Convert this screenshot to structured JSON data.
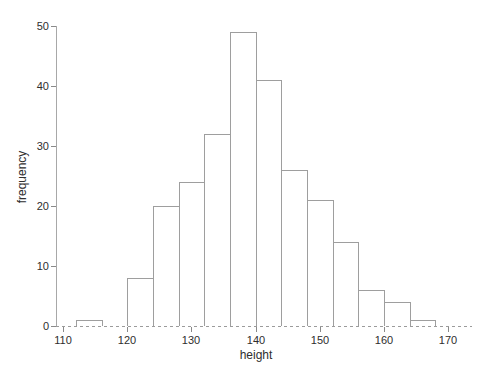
{
  "chart_data": {
    "type": "bar",
    "subtype": "histogram",
    "title": "",
    "xlabel": "height",
    "ylabel": "frequency",
    "bin_edges": [
      112,
      116,
      120,
      124,
      128,
      132,
      136,
      140,
      144,
      148,
      152,
      156,
      160,
      164,
      168
    ],
    "counts": [
      1,
      0,
      8,
      20,
      24,
      32,
      49,
      41,
      26,
      21,
      14,
      6,
      4,
      1
    ],
    "x_ticks": [
      110,
      120,
      130,
      140,
      150,
      160,
      170
    ],
    "y_ticks": [
      0,
      10,
      20,
      30,
      40,
      50
    ],
    "xlim": [
      110,
      170
    ],
    "ylim": [
      0,
      50
    ],
    "grid": "off",
    "legend": "none",
    "bar_fill": "#ffffff",
    "bar_border": "#9e9e9e"
  },
  "colors": {
    "background": "#ffffff",
    "axis": "#a8a8a8",
    "tick": "#8a8a8a",
    "text": "#2e2e2e"
  }
}
